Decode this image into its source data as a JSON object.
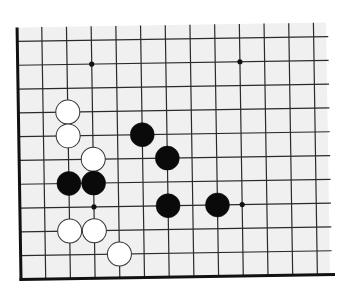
{
  "board": {
    "colors": {
      "background": "#f0f0f0",
      "line": "#2a2a2a",
      "edge": "#111111",
      "black_stone": "#0a0a0a",
      "white_stone": "#ffffff",
      "white_outline": "#333333"
    },
    "grid": {
      "origin_x": 19,
      "origin_y": 39,
      "spacing_x": 24.7,
      "spacing_y": 23.8,
      "columns": 13,
      "rows": 11,
      "right_extent": 328,
      "top_extent": 25,
      "edges": [
        "left",
        "bottom"
      ],
      "rotation_deg": -0.9
    },
    "star_points": [
      {
        "col": 3,
        "row": 1
      },
      {
        "col": 9,
        "row": 1
      },
      {
        "col": 3,
        "row": 7
      },
      {
        "col": 9,
        "row": 7
      }
    ],
    "stones": [
      {
        "color": "white",
        "col": 2,
        "row": 3
      },
      {
        "color": "white",
        "col": 2,
        "row": 4
      },
      {
        "color": "white",
        "col": 3,
        "row": 5
      },
      {
        "color": "white",
        "col": 2,
        "row": 8
      },
      {
        "color": "white",
        "col": 3,
        "row": 8
      },
      {
        "color": "white",
        "col": 4,
        "row": 9
      },
      {
        "color": "black",
        "col": 5,
        "row": 4
      },
      {
        "color": "black",
        "col": 6,
        "row": 5
      },
      {
        "color": "black",
        "col": 2,
        "row": 6
      },
      {
        "color": "black",
        "col": 3,
        "row": 6
      },
      {
        "color": "black",
        "col": 6,
        "row": 7
      },
      {
        "color": "black",
        "col": 8,
        "row": 7
      }
    ],
    "stone_radius": 12
  }
}
